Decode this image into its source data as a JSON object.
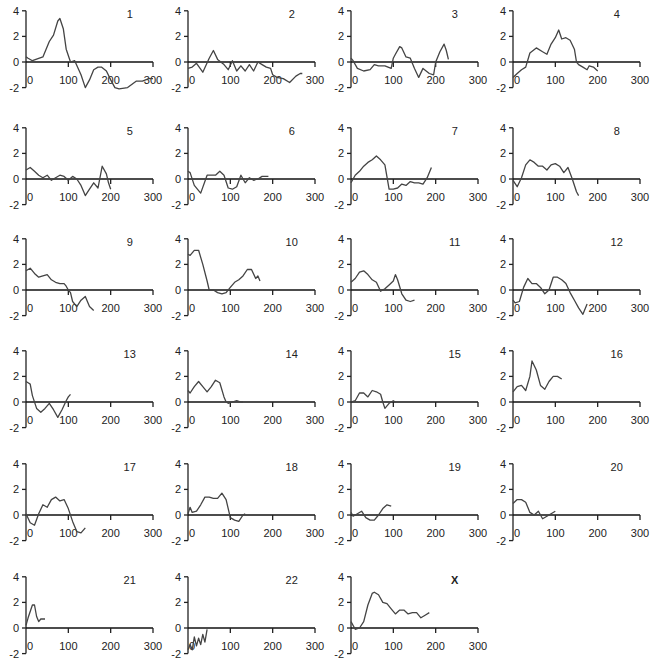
{
  "chart_data": {
    "type": "line",
    "layout": {
      "rows": 6,
      "cols": 4,
      "grid": false,
      "legend": "none"
    },
    "shared_axes": {
      "xlim": [
        0,
        300
      ],
      "ylim": [
        -2,
        4
      ],
      "xticks": [
        0,
        100,
        200,
        300
      ],
      "yticks": [
        -2,
        0,
        2,
        4
      ]
    },
    "panels": [
      {
        "label": "1",
        "x": [
          0,
          5,
          15,
          40,
          55,
          65,
          75,
          80,
          88,
          95,
          105,
          115,
          130,
          140,
          150,
          160,
          170,
          178,
          190,
          200,
          210,
          220,
          240,
          260,
          275,
          290,
          300
        ],
        "y": [
          0.4,
          0.3,
          0.1,
          0.4,
          1.6,
          2.1,
          3.2,
          3.4,
          2.6,
          1.0,
          0.0,
          0.1,
          -1.0,
          -2.0,
          -1.4,
          -0.6,
          -0.4,
          -0.4,
          -0.7,
          -1.4,
          -2.0,
          -2.1,
          -2.0,
          -1.5,
          -1.5,
          -1.3,
          -1.3
        ]
      },
      {
        "label": "2",
        "x": [
          0,
          10,
          20,
          35,
          50,
          60,
          70,
          85,
          95,
          105,
          115,
          125,
          135,
          145,
          155,
          165,
          175,
          185,
          195,
          200,
          210,
          225,
          240,
          255,
          265,
          270
        ],
        "y": [
          -0.5,
          -0.4,
          -0.1,
          -0.8,
          0.3,
          0.9,
          0.2,
          -0.2,
          -0.6,
          0.1,
          -0.7,
          -0.3,
          -0.7,
          -0.2,
          -0.7,
          0.0,
          -0.2,
          -0.4,
          -0.5,
          -1.0,
          -1.2,
          -1.3,
          -1.6,
          -1.1,
          -0.9,
          -0.9
        ]
      },
      {
        "label": "3",
        "x": [
          0,
          5,
          15,
          30,
          45,
          55,
          65,
          80,
          95,
          100,
          105,
          115,
          120,
          130,
          140,
          150,
          160,
          170,
          185,
          195,
          200,
          210,
          220,
          225,
          230
        ],
        "y": [
          0.3,
          0.1,
          -0.5,
          -0.7,
          -0.6,
          -0.2,
          -0.3,
          -0.3,
          -0.5,
          0.3,
          0.6,
          1.2,
          1.1,
          0.4,
          0.3,
          -0.5,
          -1.2,
          -0.5,
          -0.9,
          -1.0,
          0.0,
          0.8,
          1.4,
          0.9,
          0.2
        ]
      },
      {
        "label": "4",
        "x": [
          0,
          10,
          20,
          30,
          40,
          55,
          70,
          80,
          90,
          100,
          108,
          115,
          125,
          135,
          145,
          150,
          155,
          165,
          175,
          180,
          190,
          200
        ],
        "y": [
          -1.2,
          -0.9,
          -0.6,
          -0.4,
          0.7,
          1.1,
          0.8,
          0.6,
          1.4,
          1.9,
          2.5,
          1.8,
          1.9,
          1.7,
          1.0,
          0.0,
          -0.2,
          -0.4,
          -0.6,
          -0.3,
          -0.4,
          -0.7
        ]
      },
      {
        "label": "5",
        "x": [
          0,
          10,
          20,
          30,
          40,
          50,
          60,
          70,
          80,
          90,
          100,
          110,
          120,
          130,
          140,
          150,
          160,
          170,
          180,
          190,
          195,
          200
        ],
        "y": [
          0.7,
          0.9,
          0.6,
          0.3,
          0.1,
          0.3,
          -0.1,
          0.1,
          0.3,
          0.2,
          -0.1,
          0.2,
          0.0,
          -0.5,
          -1.3,
          -0.8,
          -0.3,
          -0.7,
          1.0,
          0.4,
          -0.3,
          -0.8
        ]
      },
      {
        "label": "6",
        "x": [
          0,
          5,
          15,
          30,
          45,
          55,
          65,
          75,
          85,
          95,
          105,
          115,
          125,
          135,
          145,
          155,
          165,
          175,
          190
        ],
        "y": [
          0.6,
          0.5,
          -0.5,
          -1.1,
          0.3,
          0.3,
          0.3,
          0.6,
          0.3,
          -0.7,
          -0.8,
          -0.6,
          0.3,
          -0.3,
          0.1,
          -0.1,
          0.0,
          0.2,
          0.2
        ]
      },
      {
        "label": "7",
        "x": [
          0,
          10,
          20,
          30,
          40,
          50,
          60,
          70,
          80,
          90,
          100,
          110,
          120,
          130,
          140,
          150,
          160,
          170,
          180,
          190
        ],
        "y": [
          -0.3,
          0.3,
          0.6,
          1.0,
          1.3,
          1.5,
          1.8,
          1.5,
          1.1,
          -0.8,
          -0.8,
          -0.7,
          -0.4,
          -0.5,
          -0.2,
          -0.3,
          -0.3,
          -0.4,
          0.1,
          0.9
        ]
      },
      {
        "label": "8",
        "x": [
          0,
          10,
          20,
          30,
          40,
          50,
          60,
          70,
          80,
          90,
          100,
          110,
          120,
          130,
          140,
          150,
          155
        ],
        "y": [
          -0.1,
          -0.6,
          0.1,
          1.1,
          1.5,
          1.3,
          1.0,
          1.0,
          0.7,
          1.1,
          1.2,
          1.0,
          0.5,
          0.9,
          0.0,
          -1.0,
          -1.3
        ]
      },
      {
        "label": "9",
        "x": [
          0,
          10,
          20,
          30,
          40,
          50,
          60,
          70,
          80,
          90,
          95,
          100,
          105,
          110,
          120,
          130,
          140,
          150,
          160
        ],
        "y": [
          1.5,
          1.7,
          1.3,
          1.0,
          1.1,
          1.2,
          0.8,
          0.6,
          0.5,
          0.5,
          0.3,
          0.0,
          -0.2,
          -0.9,
          -1.3,
          -0.8,
          -0.5,
          -1.3,
          -1.6
        ]
      },
      {
        "label": "10",
        "x": [
          0,
          5,
          15,
          25,
          35,
          45,
          50,
          60,
          70,
          80,
          90,
          100,
          110,
          120,
          130,
          140,
          150,
          160,
          165,
          170
        ],
        "y": [
          2.8,
          2.7,
          3.1,
          3.1,
          2.0,
          0.7,
          0.0,
          0.0,
          -0.2,
          -0.3,
          -0.2,
          0.2,
          0.6,
          0.8,
          1.1,
          1.6,
          1.6,
          0.9,
          1.1,
          0.7
        ]
      },
      {
        "label": "11",
        "x": [
          0,
          10,
          20,
          30,
          40,
          50,
          60,
          70,
          80,
          90,
          100,
          105,
          110,
          120,
          130,
          140,
          150
        ],
        "y": [
          0.6,
          0.9,
          1.4,
          1.5,
          1.2,
          0.8,
          0.6,
          -0.1,
          0.1,
          0.4,
          0.7,
          1.2,
          0.8,
          -0.3,
          -0.8,
          -0.9,
          -0.8
        ]
      },
      {
        "label": "12",
        "x": [
          0,
          5,
          15,
          25,
          35,
          45,
          55,
          65,
          75,
          85,
          95,
          105,
          115,
          125,
          135,
          145,
          155,
          165,
          175
        ],
        "y": [
          -0.8,
          -1.0,
          -0.9,
          0.2,
          0.9,
          0.5,
          0.5,
          0.2,
          -0.3,
          0.0,
          1.0,
          1.0,
          0.8,
          0.5,
          -0.2,
          -0.8,
          -1.4,
          -1.9,
          -1.1
        ]
      },
      {
        "label": "13",
        "x": [
          0,
          5,
          10,
          15,
          25,
          35,
          45,
          55,
          65,
          75,
          85,
          95,
          100,
          105
        ],
        "y": [
          1.6,
          1.5,
          1.4,
          0.5,
          -0.5,
          -0.8,
          -0.5,
          -0.1,
          -0.6,
          -1.2,
          -0.6,
          0.1,
          0.4,
          0.6
        ]
      },
      {
        "label": "14",
        "x": [
          0,
          5,
          15,
          25,
          35,
          45,
          55,
          65,
          75,
          85,
          90,
          95,
          105,
          115,
          125,
          130
        ],
        "y": [
          0.9,
          0.7,
          1.2,
          1.6,
          1.2,
          0.8,
          1.2,
          1.7,
          1.5,
          0.4,
          0.0,
          -0.1,
          0.0,
          0.1,
          0.0,
          0.0
        ]
      },
      {
        "label": "15",
        "x": [
          0,
          10,
          20,
          30,
          40,
          50,
          60,
          70,
          75,
          80,
          90,
          100,
          105
        ],
        "y": [
          0.0,
          0.1,
          0.7,
          0.7,
          0.4,
          0.9,
          0.8,
          0.6,
          0.0,
          -0.5,
          -0.1,
          0.1,
          0.0
        ]
      },
      {
        "label": "16",
        "x": [
          0,
          10,
          20,
          30,
          40,
          45,
          55,
          65,
          75,
          85,
          95,
          105,
          115
        ],
        "y": [
          0.8,
          1.2,
          1.3,
          0.9,
          2.0,
          3.2,
          2.5,
          1.3,
          1.0,
          1.6,
          2.0,
          2.0,
          1.8
        ]
      },
      {
        "label": "17",
        "x": [
          0,
          10,
          20,
          30,
          40,
          50,
          60,
          70,
          80,
          90,
          100,
          110,
          120,
          130,
          140
        ],
        "y": [
          0.1,
          -0.6,
          -0.8,
          0.1,
          0.8,
          0.6,
          1.2,
          1.4,
          1.1,
          1.2,
          0.5,
          -0.5,
          -1.3,
          -1.4,
          -1.0
        ]
      },
      {
        "label": "18",
        "x": [
          0,
          5,
          10,
          20,
          30,
          40,
          50,
          60,
          70,
          80,
          90,
          100,
          110,
          120,
          130,
          135
        ],
        "y": [
          0.1,
          0.6,
          0.2,
          0.3,
          0.8,
          1.4,
          1.4,
          1.3,
          1.3,
          1.7,
          1.2,
          -0.2,
          -0.4,
          -0.5,
          0.0,
          0.1
        ]
      },
      {
        "label": "19",
        "x": [
          0,
          5,
          15,
          25,
          35,
          45,
          55,
          65,
          75,
          85,
          95
        ],
        "y": [
          0.2,
          -0.1,
          0.1,
          0.3,
          -0.2,
          -0.4,
          -0.4,
          0.0,
          0.5,
          0.8,
          0.7
        ]
      },
      {
        "label": "20",
        "x": [
          0,
          10,
          20,
          30,
          40,
          50,
          60,
          70,
          80,
          90,
          100
        ],
        "y": [
          0.9,
          1.2,
          1.2,
          1.0,
          0.2,
          0.0,
          0.3,
          -0.3,
          -0.1,
          0.1,
          0.3
        ]
      },
      {
        "label": "21",
        "x": [
          0,
          5,
          15,
          20,
          25,
          30,
          35,
          40,
          45
        ],
        "y": [
          0.2,
          0.8,
          1.8,
          1.8,
          0.9,
          0.5,
          0.7,
          0.7,
          0.7
        ]
      },
      {
        "label": "22",
        "x": [
          0,
          5,
          10,
          15,
          20,
          25,
          30,
          35,
          40,
          45
        ],
        "y": [
          -1.7,
          -1.3,
          -1.7,
          -0.7,
          -1.4,
          -0.8,
          -1.3,
          -0.5,
          -1.1,
          -0.1
        ]
      },
      {
        "label": "X",
        "x": [
          0,
          10,
          20,
          30,
          40,
          50,
          55,
          65,
          75,
          85,
          95,
          105,
          115,
          125,
          135,
          145,
          155,
          165,
          175,
          185
        ],
        "y": [
          0.5,
          -0.1,
          0.0,
          0.5,
          1.8,
          2.7,
          2.8,
          2.6,
          2.0,
          1.9,
          1.5,
          1.1,
          1.4,
          1.4,
          1.1,
          1.2,
          1.2,
          0.8,
          1.0,
          1.2
        ]
      }
    ]
  }
}
